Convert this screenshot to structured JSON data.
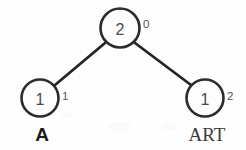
{
  "figure": {
    "kind": "binary-tree-diagram",
    "background_color": "#fefefe",
    "stroke_color": "#242424",
    "node_fill": "#fdfdfd",
    "node_text_color": "#4a4a4a",
    "index_text_color": "#555555"
  },
  "nodes": {
    "root": {
      "value": "2",
      "index": "0",
      "cx": 120,
      "cy": 28,
      "r": 19.5
    },
    "left_leaf": {
      "value": "1",
      "index": "1",
      "label": "A",
      "cx": 40,
      "cy": 98,
      "r": 18.5
    },
    "right_leaf": {
      "value": "1",
      "index": "2",
      "label": "ART",
      "cx": 205,
      "cy": 98,
      "r": 18.5
    }
  },
  "edges": [
    {
      "name": "root-to-left",
      "x1": 105,
      "y1": 43,
      "x2": 55,
      "y2": 85
    },
    {
      "name": "root-to-right",
      "x1": 135,
      "y1": 43,
      "x2": 191,
      "y2": 85
    }
  ]
}
